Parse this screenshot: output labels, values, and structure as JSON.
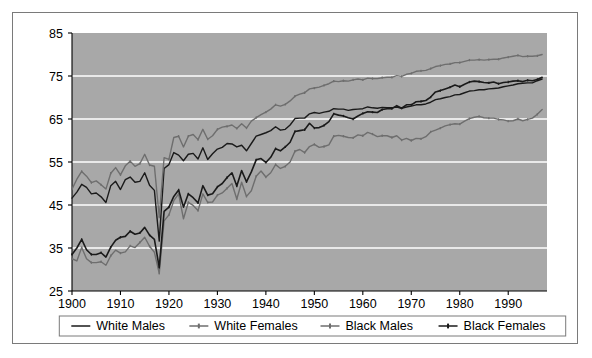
{
  "chart_data": {
    "type": "line",
    "title": "",
    "subtitle": "",
    "xlabel": "",
    "ylabel": "",
    "xlim": [
      1900,
      1998
    ],
    "ylim": [
      25,
      85
    ],
    "yticks": [
      25,
      35,
      45,
      55,
      65,
      75,
      85
    ],
    "xticks": [
      1900,
      1910,
      1920,
      1930,
      1940,
      1950,
      1960,
      1970,
      1980,
      1990
    ],
    "grid": true,
    "grid_color": "#ffffff",
    "plot_background": "#a8a8a8",
    "legend_position": "bottom",
    "x": [
      1900,
      1901,
      1902,
      1903,
      1904,
      1905,
      1906,
      1907,
      1908,
      1909,
      1910,
      1911,
      1912,
      1913,
      1914,
      1915,
      1916,
      1917,
      1918,
      1919,
      1920,
      1921,
      1922,
      1923,
      1924,
      1925,
      1926,
      1927,
      1928,
      1929,
      1930,
      1931,
      1932,
      1933,
      1934,
      1935,
      1936,
      1937,
      1938,
      1939,
      1940,
      1941,
      1942,
      1943,
      1944,
      1945,
      1946,
      1947,
      1948,
      1949,
      1950,
      1951,
      1952,
      1953,
      1954,
      1955,
      1956,
      1957,
      1958,
      1959,
      1960,
      1961,
      1962,
      1963,
      1964,
      1965,
      1966,
      1967,
      1968,
      1969,
      1970,
      1971,
      1972,
      1973,
      1974,
      1975,
      1976,
      1977,
      1978,
      1979,
      1980,
      1981,
      1982,
      1983,
      1984,
      1985,
      1986,
      1987,
      1988,
      1989,
      1990,
      1991,
      1992,
      1993,
      1994,
      1995,
      1996,
      1997
    ],
    "series": [
      {
        "name": "White Males",
        "color": "#1a1a1a",
        "marker": "none",
        "line_width": 1.4,
        "values": [
          46.6,
          48.0,
          49.8,
          49.1,
          47.6,
          47.8,
          46.9,
          45.6,
          49.5,
          50.5,
          48.6,
          50.9,
          51.5,
          50.3,
          50.5,
          52.5,
          49.6,
          48.4,
          36.6,
          53.5,
          54.4,
          57.2,
          56.6,
          55.3,
          56.8,
          57.0,
          55.7,
          58.3,
          55.6,
          56.9,
          58.0,
          58.4,
          59.3,
          59.2,
          58.5,
          58.9,
          57.6,
          59.3,
          61.0,
          61.4,
          61.8,
          62.3,
          63.2,
          62.4,
          62.6,
          63.6,
          65.1,
          65.2,
          65.2,
          66.2,
          66.5,
          66.3,
          66.6,
          66.8,
          67.4,
          67.3,
          67.3,
          67.0,
          67.2,
          67.3,
          67.4,
          67.8,
          67.6,
          67.5,
          67.7,
          67.6,
          67.6,
          67.8,
          67.5,
          67.8,
          68.0,
          68.3,
          68.3,
          68.5,
          68.9,
          69.5,
          69.7,
          70.0,
          70.2,
          70.6,
          70.7,
          71.1,
          71.5,
          71.6,
          71.8,
          71.8,
          72.0,
          72.1,
          72.2,
          72.5,
          72.7,
          72.9,
          73.2,
          73.3,
          73.4,
          73.4,
          73.9,
          74.3
        ]
      },
      {
        "name": "White Females",
        "color": "#6e6e6e",
        "marker": "tick",
        "line_width": 1.4,
        "values": [
          48.7,
          51.0,
          52.8,
          51.7,
          50.2,
          50.6,
          49.7,
          48.7,
          52.4,
          53.7,
          52.0,
          54.1,
          55.2,
          54.0,
          54.6,
          56.8,
          54.3,
          54.0,
          42.2,
          56.0,
          55.6,
          60.7,
          61.0,
          58.5,
          61.0,
          61.4,
          60.2,
          62.6,
          60.3,
          61.1,
          62.6,
          63.1,
          63.3,
          63.6,
          62.8,
          63.9,
          62.9,
          64.5,
          65.3,
          66.0,
          66.6,
          67.3,
          68.3,
          68.0,
          68.4,
          69.2,
          70.3,
          70.8,
          71.1,
          72.0,
          72.2,
          72.4,
          72.8,
          73.2,
          73.8,
          73.7,
          73.9,
          73.8,
          74.1,
          74.3,
          74.1,
          74.5,
          74.4,
          74.4,
          74.6,
          74.7,
          74.7,
          75.1,
          74.9,
          75.4,
          75.6,
          76.1,
          76.2,
          76.3,
          76.7,
          77.2,
          77.4,
          77.7,
          77.8,
          78.1,
          78.1,
          78.4,
          78.7,
          78.7,
          78.8,
          78.7,
          78.8,
          78.9,
          78.9,
          79.2,
          79.4,
          79.6,
          79.8,
          79.5,
          79.6,
          79.6,
          79.7,
          80.0
        ]
      },
      {
        "name": "Black Males",
        "color": "#6e6e6e",
        "marker": "tick",
        "line_width": 1.4,
        "values": [
          32.5,
          32.0,
          35.1,
          32.5,
          31.6,
          31.6,
          31.8,
          31.0,
          33.2,
          34.5,
          33.8,
          34.1,
          35.5,
          35.1,
          36.3,
          37.5,
          35.4,
          34.0,
          29.1,
          41.3,
          42.7,
          46.0,
          47.6,
          41.8,
          45.6,
          44.9,
          43.7,
          47.6,
          45.6,
          45.7,
          47.3,
          47.8,
          48.9,
          50.0,
          46.4,
          50.3,
          47.0,
          48.3,
          51.7,
          52.9,
          51.5,
          52.5,
          54.4,
          53.5,
          54.0,
          55.0,
          57.5,
          57.9,
          57.2,
          58.6,
          59.1,
          58.4,
          58.6,
          59.0,
          61.0,
          61.2,
          61.0,
          60.7,
          60.6,
          61.3,
          61.1,
          61.9,
          61.5,
          60.9,
          61.1,
          61.1,
          60.7,
          61.1,
          60.1,
          60.5,
          60.0,
          60.5,
          60.4,
          60.9,
          62.0,
          62.4,
          62.9,
          63.4,
          63.7,
          63.9,
          63.8,
          64.5,
          65.1,
          65.4,
          65.6,
          65.3,
          65.2,
          65.2,
          64.9,
          64.8,
          64.5,
          64.6,
          65.0,
          64.6,
          64.9,
          65.2,
          66.1,
          67.2
        ]
      },
      {
        "name": "Black Females",
        "color": "#1a1a1a",
        "marker": "tick",
        "line_width": 1.6,
        "values": [
          33.5,
          35.0,
          37.0,
          34.6,
          33.5,
          33.5,
          33.9,
          32.9,
          35.2,
          36.8,
          37.5,
          37.7,
          38.9,
          38.2,
          38.5,
          39.8,
          38.0,
          37.0,
          30.5,
          43.5,
          44.5,
          47.0,
          48.5,
          44.5,
          47.6,
          46.7,
          45.5,
          49.5,
          47.3,
          47.6,
          49.2,
          50.0,
          51.4,
          52.5,
          49.4,
          53.0,
          50.4,
          52.7,
          55.5,
          55.8,
          54.9,
          56.1,
          58.1,
          57.6,
          58.5,
          59.6,
          62.1,
          62.3,
          62.5,
          64.0,
          62.9,
          63.0,
          63.5,
          64.4,
          66.2,
          65.9,
          65.7,
          65.3,
          65.0,
          65.7,
          66.3,
          66.7,
          66.6,
          66.5,
          67.2,
          67.4,
          67.4,
          68.1,
          67.5,
          68.3,
          68.3,
          69.0,
          69.1,
          69.3,
          70.1,
          71.3,
          71.6,
          72.0,
          72.4,
          72.9,
          72.5,
          73.1,
          73.6,
          73.8,
          73.7,
          73.5,
          73.4,
          73.6,
          73.2,
          73.5,
          73.6,
          73.8,
          73.9,
          73.7,
          74.0,
          73.9,
          74.2,
          74.7
        ]
      }
    ]
  },
  "axes": {
    "y_labels": [
      "85",
      "75",
      "65",
      "55",
      "45",
      "35",
      "25"
    ],
    "x_labels": [
      "1900",
      "1910",
      "1920",
      "1930",
      "1940",
      "1950",
      "1960",
      "1970",
      "1980",
      "1990"
    ]
  },
  "legend": {
    "items": [
      {
        "label": "White Males",
        "color": "#1a1a1a",
        "marker": "none"
      },
      {
        "label": "White Females",
        "color": "#6e6e6e",
        "marker": "tick"
      },
      {
        "label": "Black Males",
        "color": "#6e6e6e",
        "marker": "tick"
      },
      {
        "label": "Black Females",
        "color": "#1a1a1a",
        "marker": "tick"
      }
    ]
  },
  "colors": {
    "plot_bg": "#a8a8a8",
    "grid": "#ffffff",
    "frame_border": "#7a7a7a",
    "axis": "#000000",
    "page_bg": "#ffffff"
  }
}
